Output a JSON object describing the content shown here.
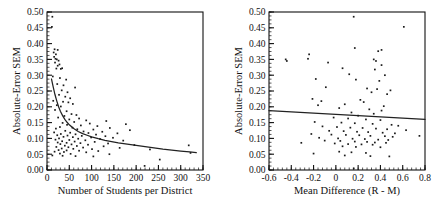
{
  "figure": {
    "background": "#ffffff",
    "marker_color": "#1a1a1a",
    "line_color": "#222222",
    "axis_color": "#111111"
  },
  "chart_data": [
    {
      "type": "scatter",
      "panel": "left",
      "title": "",
      "xlabel": "Number of  Students per District",
      "ylabel": "Absolute-Error SEM",
      "xlim": [
        0,
        350
      ],
      "ylim": [
        0.0,
        0.5
      ],
      "xticks": [
        0,
        50,
        100,
        150,
        200,
        250,
        300,
        350
      ],
      "xticklabels": [
        "0",
        "50",
        "100",
        "150",
        "200",
        "250",
        "300",
        "350"
      ],
      "yticks": [
        0.0,
        0.05,
        0.1,
        0.15,
        0.2,
        0.25,
        0.3,
        0.35,
        0.4,
        0.45,
        0.5
      ],
      "yticklabels": [
        "0.00",
        "0.05",
        "0.10",
        "0.15",
        "0.20",
        "0.25",
        "0.30",
        "0.35",
        "0.40",
        "0.45",
        "0.50"
      ],
      "x_minor_step": 10,
      "y_minor_step": 0.0125,
      "grid": false,
      "legend": null,
      "fit": {
        "kind": "power-decay",
        "description": "decreasing curve from about 0.285 at x=10 to about 0.055 at x=330",
        "points": [
          [
            10,
            0.288
          ],
          [
            14,
            0.262
          ],
          [
            18,
            0.238
          ],
          [
            22,
            0.218
          ],
          [
            26,
            0.2
          ],
          [
            30,
            0.186
          ],
          [
            35,
            0.172
          ],
          [
            40,
            0.16
          ],
          [
            45,
            0.151
          ],
          [
            50,
            0.143
          ],
          [
            60,
            0.131
          ],
          [
            70,
            0.122
          ],
          [
            80,
            0.115
          ],
          [
            90,
            0.11
          ],
          [
            100,
            0.105
          ],
          [
            115,
            0.099
          ],
          [
            130,
            0.094
          ],
          [
            145,
            0.09
          ],
          [
            160,
            0.086
          ],
          [
            180,
            0.082
          ],
          [
            200,
            0.078
          ],
          [
            220,
            0.074
          ],
          [
            240,
            0.07
          ],
          [
            260,
            0.066
          ],
          [
            280,
            0.063
          ],
          [
            300,
            0.06
          ],
          [
            320,
            0.057
          ],
          [
            335,
            0.055
          ]
        ]
      },
      "points": [
        [
          12,
          0.485
        ],
        [
          11,
          0.453
        ],
        [
          17,
          0.382
        ],
        [
          24,
          0.38
        ],
        [
          15,
          0.372
        ],
        [
          20,
          0.366
        ],
        [
          16,
          0.358
        ],
        [
          19,
          0.352
        ],
        [
          22,
          0.35
        ],
        [
          26,
          0.346
        ],
        [
          18,
          0.34
        ],
        [
          28,
          0.334
        ],
        [
          24,
          0.33
        ],
        [
          34,
          0.322
        ],
        [
          21,
          0.321
        ],
        [
          31,
          0.32
        ],
        [
          13,
          0.296
        ],
        [
          29,
          0.291
        ],
        [
          43,
          0.286
        ],
        [
          23,
          0.272
        ],
        [
          37,
          0.268
        ],
        [
          63,
          0.261
        ],
        [
          33,
          0.252
        ],
        [
          46,
          0.246
        ],
        [
          27,
          0.238
        ],
        [
          41,
          0.232
        ],
        [
          52,
          0.227
        ],
        [
          14,
          0.219
        ],
        [
          36,
          0.216
        ],
        [
          48,
          0.214
        ],
        [
          58,
          0.209
        ],
        [
          22,
          0.205
        ],
        [
          31,
          0.201
        ],
        [
          18,
          0.19
        ],
        [
          44,
          0.186
        ],
        [
          55,
          0.177
        ],
        [
          66,
          0.174
        ],
        [
          39,
          0.171
        ],
        [
          25,
          0.166
        ],
        [
          72,
          0.163
        ],
        [
          50,
          0.16
        ],
        [
          88,
          0.157
        ],
        [
          133,
          0.155
        ],
        [
          61,
          0.152
        ],
        [
          35,
          0.149
        ],
        [
          96,
          0.147
        ],
        [
          177,
          0.145
        ],
        [
          45,
          0.143
        ],
        [
          76,
          0.141
        ],
        [
          113,
          0.139
        ],
        [
          29,
          0.136
        ],
        [
          57,
          0.134
        ],
        [
          141,
          0.133
        ],
        [
          20,
          0.131
        ],
        [
          68,
          0.129
        ],
        [
          104,
          0.128
        ],
        [
          186,
          0.126
        ],
        [
          41,
          0.124
        ],
        [
          82,
          0.122
        ],
        [
          124,
          0.121
        ],
        [
          16,
          0.119
        ],
        [
          52,
          0.118
        ],
        [
          93,
          0.117
        ],
        [
          158,
          0.116
        ],
        [
          31,
          0.114
        ],
        [
          64,
          0.113
        ],
        [
          110,
          0.112
        ],
        [
          23,
          0.11
        ],
        [
          46,
          0.109
        ],
        [
          78,
          0.108
        ],
        [
          131,
          0.107
        ],
        [
          37,
          0.105
        ],
        [
          58,
          0.104
        ],
        [
          99,
          0.103
        ],
        [
          148,
          0.102
        ],
        [
          27,
          0.1
        ],
        [
          70,
          0.099
        ],
        [
          119,
          0.098
        ],
        [
          19,
          0.096
        ],
        [
          50,
          0.095
        ],
        [
          86,
          0.094
        ],
        [
          171,
          0.093
        ],
        [
          34,
          0.091
        ],
        [
          62,
          0.09
        ],
        [
          107,
          0.089
        ],
        [
          24,
          0.087
        ],
        [
          44,
          0.086
        ],
        [
          75,
          0.085
        ],
        [
          137,
          0.084
        ],
        [
          30,
          0.082
        ],
        [
          55,
          0.081
        ],
        [
          92,
          0.08
        ],
        [
          196,
          0.079
        ],
        [
          318,
          0.078
        ],
        [
          40,
          0.077
        ],
        [
          67,
          0.076
        ],
        [
          127,
          0.075
        ],
        [
          21,
          0.073
        ],
        [
          48,
          0.072
        ],
        [
          81,
          0.071
        ],
        [
          163,
          0.07
        ],
        [
          33,
          0.068
        ],
        [
          59,
          0.067
        ],
        [
          101,
          0.066
        ],
        [
          231,
          0.065
        ],
        [
          26,
          0.063
        ],
        [
          44,
          0.062
        ],
        [
          72,
          0.061
        ],
        [
          115,
          0.06
        ],
        [
          17,
          0.058
        ],
        [
          38,
          0.057
        ],
        [
          88,
          0.056
        ],
        [
          322,
          0.054
        ],
        [
          29,
          0.052
        ],
        [
          53,
          0.051
        ],
        [
          140,
          0.05
        ],
        [
          253,
          0.033
        ],
        [
          12,
          0.046
        ],
        [
          35,
          0.045
        ],
        [
          64,
          0.044
        ],
        [
          104,
          0.043
        ],
        [
          219,
          0.013
        ]
      ]
    },
    {
      "type": "scatter",
      "panel": "right",
      "title": "",
      "xlabel": "Mean Difference (R - M)",
      "ylabel": "Absolute-Error SEM",
      "xlim": [
        -0.6,
        0.8
      ],
      "ylim": [
        0.0,
        0.5
      ],
      "xticks": [
        -0.6,
        -0.4,
        -0.2,
        0,
        0.2,
        0.4,
        0.6,
        0.8
      ],
      "xticklabels": [
        "-0.6",
        "-0.4",
        "-0.2",
        "0",
        "0.2",
        "0.4",
        "0.6",
        "0.8"
      ],
      "yticks": [
        0.0,
        0.05,
        0.1,
        0.15,
        0.2,
        0.25,
        0.3,
        0.35,
        0.4,
        0.45,
        0.5
      ],
      "yticklabels": [
        "0.00",
        "0.05",
        "0.10",
        "0.15",
        "0.20",
        "0.25",
        "0.30",
        "0.35",
        "0.40",
        "0.45",
        "0.50"
      ],
      "x_minor_step": 0.04,
      "y_minor_step": 0.0125,
      "grid": false,
      "legend": null,
      "fit": {
        "kind": "linear",
        "description": "nearly flat slightly decreasing regression line",
        "x0": -0.6,
        "y0": 0.188,
        "x1": 0.8,
        "y1": 0.16
      },
      "points": [
        [
          0.16,
          0.485
        ],
        [
          0.61,
          0.453
        ],
        [
          0.17,
          0.386
        ],
        [
          0.41,
          0.38
        ],
        [
          0.38,
          0.376
        ],
        [
          -0.45,
          0.35
        ],
        [
          -0.44,
          0.345
        ],
        [
          -0.24,
          0.366
        ],
        [
          -0.25,
          0.352
        ],
        [
          0.34,
          0.35
        ],
        [
          0.36,
          0.345
        ],
        [
          -0.07,
          0.34
        ],
        [
          0.41,
          0.332
        ],
        [
          0.06,
          0.322
        ],
        [
          0.35,
          0.318
        ],
        [
          0.12,
          0.303
        ],
        [
          0.44,
          0.3
        ],
        [
          -0.18,
          0.288
        ],
        [
          0.18,
          0.286
        ],
        [
          0.39,
          0.282
        ],
        [
          -0.09,
          0.262
        ],
        [
          0.28,
          0.258
        ],
        [
          0.37,
          0.256
        ],
        [
          0.49,
          0.252
        ],
        [
          0.32,
          0.246
        ],
        [
          0.46,
          0.24
        ],
        [
          -0.21,
          0.225
        ],
        [
          -0.13,
          0.218
        ],
        [
          0.22,
          0.222
        ],
        [
          0.25,
          0.215
        ],
        [
          -0.16,
          0.205
        ],
        [
          0.08,
          0.208
        ],
        [
          0.43,
          0.202
        ],
        [
          0.03,
          0.196
        ],
        [
          0.3,
          0.192
        ],
        [
          0.41,
          0.188
        ],
        [
          0.14,
          0.182
        ],
        [
          0.34,
          0.178
        ],
        [
          0.2,
          0.172
        ],
        [
          -0.02,
          0.166
        ],
        [
          0.11,
          0.163
        ],
        [
          0.27,
          0.16
        ],
        [
          0.4,
          0.158
        ],
        [
          -0.19,
          0.152
        ],
        [
          0.05,
          0.15
        ],
        [
          0.17,
          0.148
        ],
        [
          0.33,
          0.146
        ],
        [
          0.5,
          0.143
        ],
        [
          0.56,
          0.14
        ],
        [
          0.75,
          0.108
        ],
        [
          -0.12,
          0.138
        ],
        [
          0.01,
          0.136
        ],
        [
          0.13,
          0.134
        ],
        [
          0.24,
          0.133
        ],
        [
          0.36,
          0.131
        ],
        [
          0.46,
          0.129
        ],
        [
          0.63,
          0.126
        ],
        [
          -0.06,
          0.124
        ],
        [
          0.07,
          0.123
        ],
        [
          0.19,
          0.121
        ],
        [
          0.29,
          0.12
        ],
        [
          0.42,
          0.118
        ],
        [
          0.53,
          0.116
        ],
        [
          -0.22,
          0.114
        ],
        [
          -0.04,
          0.112
        ],
        [
          0.09,
          0.111
        ],
        [
          0.21,
          0.11
        ],
        [
          0.31,
          0.108
        ],
        [
          0.44,
          0.107
        ],
        [
          0.51,
          0.105
        ],
        [
          -0.31,
          0.086
        ],
        [
          -0.15,
          0.102
        ],
        [
          0.02,
          0.1
        ],
        [
          0.15,
          0.099
        ],
        [
          0.26,
          0.098
        ],
        [
          0.38,
          0.096
        ],
        [
          0.47,
          0.095
        ],
        [
          -0.1,
          0.093
        ],
        [
          0.04,
          0.092
        ],
        [
          0.17,
          0.09
        ],
        [
          0.28,
          0.089
        ],
        [
          0.35,
          0.087
        ],
        [
          0.45,
          0.086
        ],
        [
          -0.01,
          0.084
        ],
        [
          0.11,
          0.082
        ],
        [
          0.23,
          0.081
        ],
        [
          0.33,
          0.08
        ],
        [
          0.06,
          0.075
        ],
        [
          0.18,
          0.073
        ],
        [
          0.4,
          0.072
        ],
        [
          -0.2,
          0.052
        ],
        [
          0.03,
          0.058
        ],
        [
          0.14,
          0.056
        ],
        [
          0.27,
          0.054
        ],
        [
          0.48,
          0.043
        ],
        [
          0.08,
          0.046
        ],
        [
          0.31,
          0.044
        ],
        [
          0.16,
          0.005
        ]
      ]
    }
  ]
}
